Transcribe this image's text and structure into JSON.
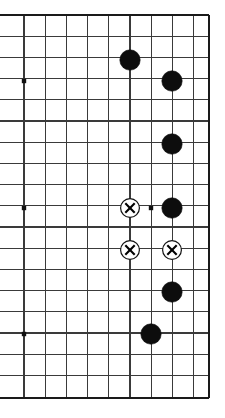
{
  "diagram": {
    "type": "go-board",
    "board_size": 19,
    "view": "partial board, right edge visible",
    "background_color": "#ffffff",
    "line_color": "#3a3a3a",
    "border_color": "#1a1a1a",
    "black_stone_color": "#0d0d0d",
    "white_stone_color": "#ffffff",
    "mark_color": "#000000",
    "geometry": {
      "cell": 21.2,
      "origin_x": 24,
      "origin_y": 15,
      "cols": 9,
      "rows": 19,
      "left_clipped": true,
      "stone_radius": 10.2,
      "mark_stone_radius": 9.4
    },
    "grid": {
      "vertical_x": [
        24,
        45.2,
        66.4,
        87.6,
        108.8,
        130,
        151.2,
        172.4,
        193.6,
        208.8
      ],
      "horizontal_y": [
        15,
        36.2,
        57.4,
        78.6,
        99.8,
        121,
        142.2,
        163.4,
        184.6,
        205.8,
        227,
        248.2,
        269.4,
        290.6,
        311.8,
        333,
        354.2,
        375.4,
        397.5
      ]
    },
    "border_lines": {
      "top": 15,
      "bottom": 398,
      "right": 209
    },
    "star_points": [
      {
        "name": "star-point-left-upper",
        "x": 24,
        "y": 81
      },
      {
        "name": "star-point-left-middle",
        "x": 24,
        "y": 208
      },
      {
        "name": "star-point-left-lower",
        "x": 24,
        "y": 334
      },
      {
        "name": "star-point-right-middle",
        "x": 151,
        "y": 208
      }
    ],
    "stones": [
      {
        "id": 1,
        "color": "black",
        "mark": "none",
        "x": 130,
        "y": 60,
        "label": "black-stone"
      },
      {
        "id": 2,
        "color": "black",
        "mark": "none",
        "x": 172,
        "y": 81,
        "label": "black-stone"
      },
      {
        "id": 3,
        "color": "black",
        "mark": "none",
        "x": 172,
        "y": 144,
        "label": "black-stone"
      },
      {
        "id": 4,
        "color": "white",
        "mark": "cross",
        "x": 130,
        "y": 208,
        "label": "white-stone-marked"
      },
      {
        "id": 5,
        "color": "black",
        "mark": "none",
        "x": 172,
        "y": 208,
        "label": "black-stone"
      },
      {
        "id": 6,
        "color": "white",
        "mark": "cross",
        "x": 130,
        "y": 250,
        "label": "white-stone-marked"
      },
      {
        "id": 7,
        "color": "white",
        "mark": "cross",
        "x": 172,
        "y": 250,
        "label": "white-stone-marked"
      },
      {
        "id": 8,
        "color": "black",
        "mark": "none",
        "x": 172,
        "y": 292,
        "label": "black-stone"
      },
      {
        "id": 9,
        "color": "black",
        "mark": "none",
        "x": 151,
        "y": 334,
        "label": "black-stone"
      }
    ],
    "counts": {
      "black_stones": 6,
      "white_stones": 3,
      "marked_stones": 3
    }
  }
}
